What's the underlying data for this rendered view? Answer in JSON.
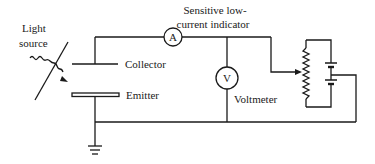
{
  "diagram": {
    "type": "circuit",
    "labels": {
      "light_source_line1": "Light",
      "light_source_line2": "source",
      "collector": "Collector",
      "emitter": "Emitter",
      "indicator_line1": "Sensitive low-",
      "indicator_line2": "current indicator",
      "voltmeter": "Voltmeter"
    },
    "meters": {
      "ammeter_symbol": "A",
      "voltmeter_symbol": "V"
    },
    "components": [
      "light-source",
      "collector-plate",
      "emitter-plate",
      "ammeter",
      "voltmeter",
      "potentiometer",
      "battery",
      "ground"
    ],
    "colors": {
      "line": "#1a1a1a",
      "background": "#ffffff"
    }
  }
}
